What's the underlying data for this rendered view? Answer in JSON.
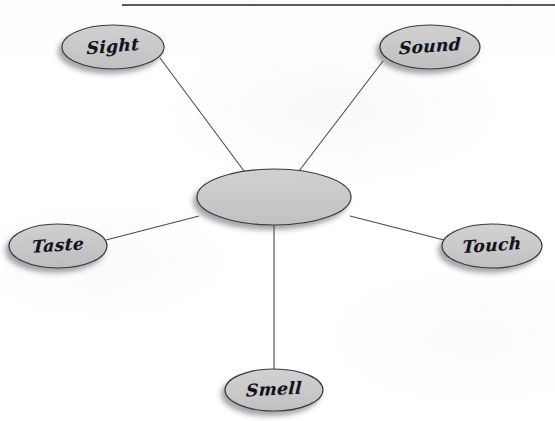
{
  "document": {
    "type": "worksheet-concept-map",
    "title": "Five Senses Spider Map",
    "topic_node_text": "",
    "background_color": "#ffffff",
    "ink_color": "#13131f"
  },
  "rule": {
    "name": "top-horizontal-rule",
    "color": "#5a5a62",
    "x_start": 122,
    "x_end": 555,
    "y": 5,
    "thickness": 2
  },
  "diagram": {
    "shape_fill": "#c9c9c9",
    "shape_stroke": "#3a3a42",
    "shadow_color": "rgba(60,60,70,0.45)",
    "connector_color": "#4a4a52",
    "center": {
      "name": "center-node",
      "label": "",
      "cx": 274,
      "cy": 197,
      "rx": 77,
      "ry": 28
    },
    "nodes": [
      {
        "id": "sight",
        "label": "Sight",
        "cx": 113,
        "cy": 47,
        "rx": 51,
        "ry": 22,
        "rotate": -5,
        "font_size": 17,
        "connector": {
          "x1": 160,
          "y1": 58,
          "x2": 244,
          "y2": 171
        }
      },
      {
        "id": "sound",
        "label": "Sound",
        "cx": 430,
        "cy": 47,
        "rx": 50,
        "ry": 22,
        "rotate": -4,
        "font_size": 17,
        "connector": {
          "x1": 383,
          "y1": 61,
          "x2": 299,
          "y2": 171
        }
      },
      {
        "id": "taste",
        "label": "Taste",
        "cx": 58,
        "cy": 246,
        "rx": 49,
        "ry": 22,
        "rotate": -4,
        "font_size": 17,
        "connector": {
          "x1": 106,
          "y1": 240,
          "x2": 199,
          "y2": 216
        }
      },
      {
        "id": "touch",
        "label": "Touch",
        "cx": 492,
        "cy": 246,
        "rx": 50,
        "ry": 22,
        "rotate": -4,
        "font_size": 17,
        "connector": {
          "x1": 444,
          "y1": 240,
          "x2": 350,
          "y2": 216
        }
      },
      {
        "id": "smell",
        "label": "Smell",
        "cx": 274,
        "cy": 390,
        "rx": 49,
        "ry": 21,
        "rotate": -3,
        "font_size": 17,
        "connector": {
          "x1": 274,
          "y1": 225,
          "x2": 274,
          "y2": 369
        }
      }
    ]
  }
}
